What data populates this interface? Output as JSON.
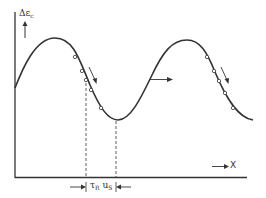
{
  "diagram": {
    "y_axis_label": {
      "main": "Δε",
      "sub": "c"
    },
    "x_axis_label": "X",
    "interval_label": {
      "tau": "τ",
      "tau_sub": "R",
      "u": "u",
      "u_sub": "S"
    },
    "colors": {
      "line": "#333333",
      "background": "#ffffff"
    },
    "curve": {
      "type": "sinusoidal wave",
      "start": [
        15,
        88
      ],
      "peak_1": [
        55,
        38
      ],
      "trough_1": [
        118,
        120
      ],
      "peak_2": [
        187,
        40
      ],
      "end": [
        253,
        120
      ]
    },
    "markers_descent_1": [
      [
        75,
        57
      ],
      [
        83,
        71
      ],
      [
        87,
        80
      ],
      [
        91,
        89
      ],
      [
        101,
        108
      ]
    ],
    "markers_descent_2": [
      [
        207,
        57
      ],
      [
        214,
        71
      ],
      [
        219,
        81
      ],
      [
        225,
        93
      ],
      [
        233,
        108
      ]
    ],
    "dashed_lines_x": [
      86,
      116
    ]
  }
}
